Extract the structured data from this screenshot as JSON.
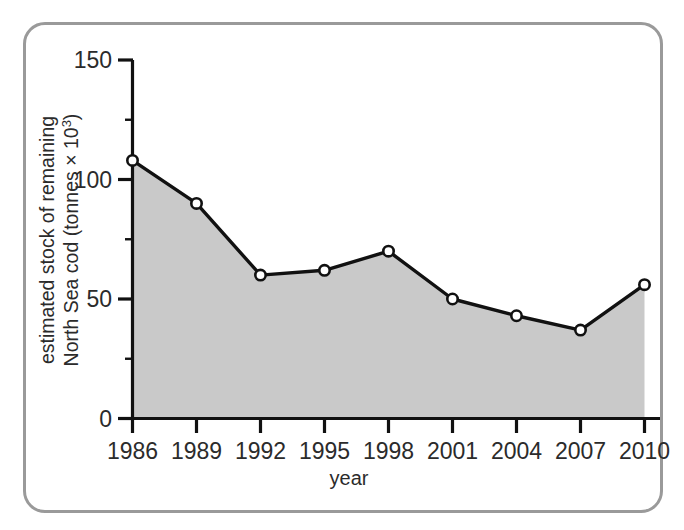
{
  "figure": {
    "frame_color": "#9a9a9a",
    "background": "#ffffff"
  },
  "chart_data": {
    "type": "area",
    "title": "",
    "subtitle": "",
    "xlabel": "year",
    "ylabel_line1": "estimated stock of remaining",
    "ylabel_line2_prefix": "North Sea cod (tonnes × 10",
    "ylabel_line2_superscript": "3",
    "ylabel_line2_suffix": ")",
    "categories": [
      "1986",
      "1989",
      "1992",
      "1995",
      "1998",
      "2001",
      "2004",
      "2007",
      "2010"
    ],
    "x": [
      1986,
      1989,
      1992,
      1995,
      1998,
      2001,
      2004,
      2007,
      2010
    ],
    "values": [
      108,
      90,
      60,
      62,
      70,
      50,
      43,
      37,
      56
    ],
    "ylim": [
      0,
      150
    ],
    "xlim": [
      1986,
      2010
    ],
    "y_ticks_major": [
      0,
      50,
      100,
      150
    ],
    "y_tick_labels": [
      "0",
      "50",
      "100",
      "150"
    ],
    "y_ticks_minor": [
      25,
      75,
      125
    ],
    "x_ticks": [
      1986,
      1989,
      1992,
      1995,
      1998,
      2001,
      2004,
      2007,
      2010
    ],
    "grid": false,
    "legend": false,
    "legend_position": "none",
    "marker": "open-circle",
    "series": [
      {
        "name": "estimated stock of remaining North Sea cod",
        "values": [
          108,
          90,
          60,
          62,
          70,
          50,
          43,
          37,
          56
        ],
        "line_color": "#111111",
        "fill_color": "#c9c9c9",
        "marker_fill": "#ffffff",
        "marker_edge": "#111111"
      }
    ],
    "annotations": [],
    "units": "tonnes × 10^3"
  }
}
